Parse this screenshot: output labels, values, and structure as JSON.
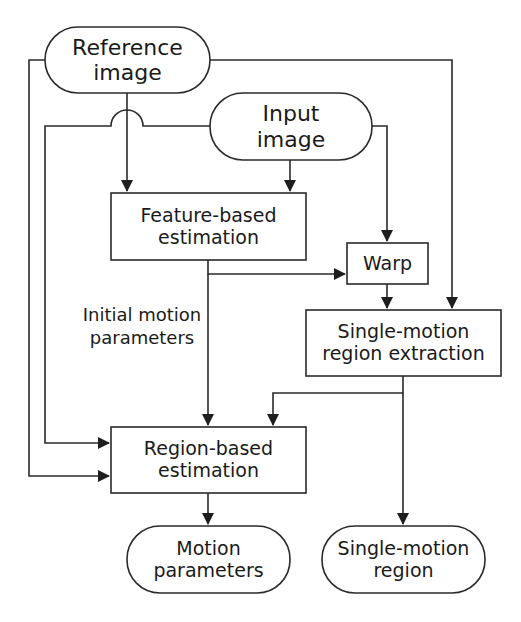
{
  "diagram": {
    "type": "flowchart",
    "nodes": {
      "reference_image": {
        "shape": "terminal",
        "line1": "Reference",
        "line2": "image"
      },
      "input_image": {
        "shape": "terminal",
        "line1": "Input",
        "line2": "image"
      },
      "feature_based": {
        "shape": "process",
        "line1": "Feature-based",
        "line2": "estimation"
      },
      "warp": {
        "shape": "process",
        "line1": "Warp"
      },
      "single_motion_extraction": {
        "shape": "process",
        "line1": "Single-motion",
        "line2": "region extraction"
      },
      "region_based": {
        "shape": "process",
        "line1": "Region-based",
        "line2": "estimation"
      },
      "motion_parameters": {
        "shape": "terminal",
        "line1": "Motion",
        "line2": "parameters"
      },
      "single_motion_region": {
        "shape": "terminal",
        "line1": "Single-motion",
        "line2": "region"
      }
    },
    "edge_labels": {
      "initial_motion": {
        "line1": "Initial motion",
        "line2": "parameters"
      }
    },
    "edges": [
      {
        "from": "reference_image",
        "to": "feature_based"
      },
      {
        "from": "reference_image",
        "to": "region_based"
      },
      {
        "from": "reference_image",
        "to": "single_motion_extraction"
      },
      {
        "from": "input_image",
        "to": "feature_based"
      },
      {
        "from": "input_image",
        "to": "warp"
      },
      {
        "from": "input_image",
        "to": "region_based"
      },
      {
        "from": "feature_based",
        "to": "warp"
      },
      {
        "from": "feature_based",
        "to": "region_based",
        "label": "Initial motion parameters"
      },
      {
        "from": "warp",
        "to": "single_motion_extraction"
      },
      {
        "from": "single_motion_extraction",
        "to": "region_based"
      },
      {
        "from": "single_motion_extraction",
        "to": "single_motion_region"
      },
      {
        "from": "region_based",
        "to": "motion_parameters"
      }
    ],
    "colors": {
      "stroke": "#2a2a2a",
      "text": "#1a1a1a",
      "background": "#ffffff"
    }
  }
}
